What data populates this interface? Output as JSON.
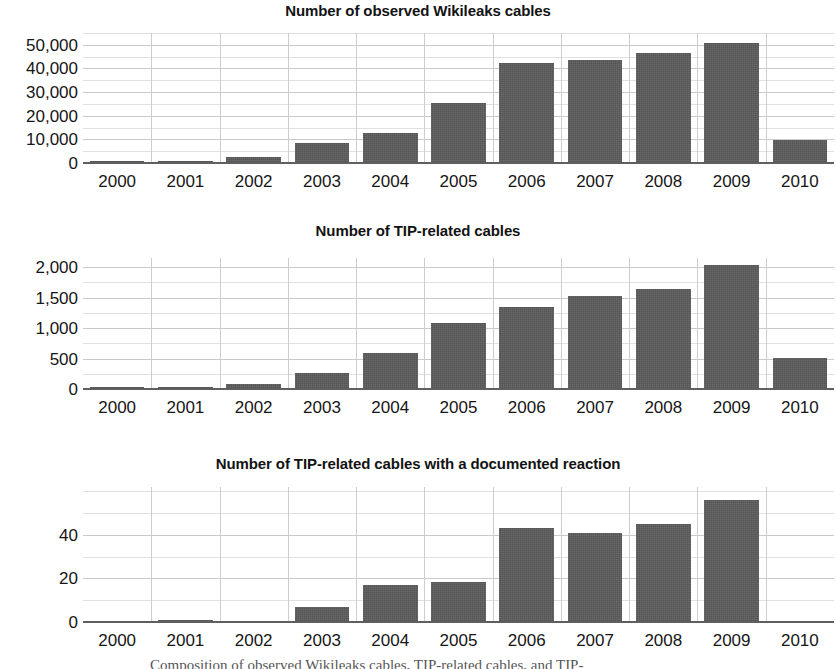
{
  "figure": {
    "caption_partial": "Composition of observed Wikileaks cables, TIP-related cables, and TIP-"
  },
  "chart_data": [
    {
      "type": "bar",
      "title": "Number of observed Wikileaks cables",
      "xlabel": "",
      "ylabel": "",
      "categories": [
        "2000",
        "2001",
        "2002",
        "2003",
        "2004",
        "2005",
        "2006",
        "2007",
        "2008",
        "2009",
        "2010"
      ],
      "values": [
        300,
        700,
        2600,
        8600,
        12600,
        25200,
        42500,
        43700,
        46600,
        50800,
        9900
      ],
      "ytick_labels": [
        "0",
        "10,000",
        "20,000",
        "30,000",
        "40,000",
        "50,000"
      ],
      "ytick_values": [
        0,
        10000,
        20000,
        30000,
        40000,
        50000
      ],
      "ylim": [
        0,
        55000
      ],
      "minor_tick_step": 5000,
      "grid": true,
      "legend": "none",
      "bar_color": "#5b5b5b"
    },
    {
      "type": "bar",
      "title": "Number of TIP-related cables",
      "xlabel": "",
      "ylabel": "",
      "categories": [
        "2000",
        "2001",
        "2002",
        "2003",
        "2004",
        "2005",
        "2006",
        "2007",
        "2008",
        "2009",
        "2010"
      ],
      "values": [
        8,
        30,
        85,
        255,
        585,
        1080,
        1340,
        1525,
        1645,
        2040,
        515
      ],
      "ytick_labels": [
        "0",
        "500",
        "1,000",
        "1,500",
        "2,000"
      ],
      "ytick_values": [
        0,
        500,
        1000,
        1500,
        2000
      ],
      "ylim": [
        0,
        2150
      ],
      "minor_tick_step": 250,
      "grid": true,
      "legend": "none",
      "bar_color": "#5b5b5b"
    },
    {
      "type": "bar",
      "title": "Number of TIP-related cables with a documented reaction",
      "xlabel": "",
      "ylabel": "",
      "categories": [
        "2000",
        "2001",
        "2002",
        "2003",
        "2004",
        "2005",
        "2006",
        "2007",
        "2008",
        "2009",
        "2010"
      ],
      "values": [
        0,
        1,
        0,
        7,
        17,
        18.5,
        43,
        41,
        45,
        56,
        0
      ],
      "ytick_labels": [
        "0",
        "20",
        "40"
      ],
      "ytick_values": [
        0,
        20,
        40
      ],
      "ylim": [
        0,
        62
      ],
      "minor_tick_step": 10,
      "grid": true,
      "legend": "none",
      "bar_color": "#5b5b5b"
    }
  ]
}
